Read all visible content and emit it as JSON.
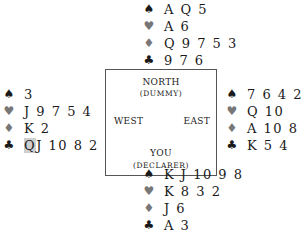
{
  "hands": {
    "north": {
      "spades": "A Q 5",
      "hearts": "A 6",
      "diamonds": "Q 9 7 5 3",
      "clubs": "9 7 6"
    },
    "west": {
      "spades": "3",
      "hearts": "J 9 7 5 4",
      "diamonds": "K 2",
      "clubs_highlighted": "Q",
      "clubs_rest": "J 10 8 2"
    },
    "east": {
      "spades": "7 6 4 2",
      "hearts": "Q 10",
      "diamonds": "A 10 8 4",
      "clubs": "K 5 4"
    },
    "south": {
      "spades": "K J 10 9 8",
      "hearts": "K 8 3 2",
      "diamonds": "J 6",
      "clubs": "A 3"
    }
  },
  "suits": {
    "spade": "♠",
    "heart": "♥",
    "diamond": "♦",
    "club": "♣"
  },
  "table": {
    "north": "NORTH",
    "north_sub": "(DUMMY)",
    "west": "WEST",
    "east": "EAST",
    "south": "YOU",
    "south_sub": "(DECLARER)"
  },
  "colors": {
    "black_suits": "#1a1a1a",
    "red_suits": "#777777",
    "highlight": "#cfcfcf"
  }
}
